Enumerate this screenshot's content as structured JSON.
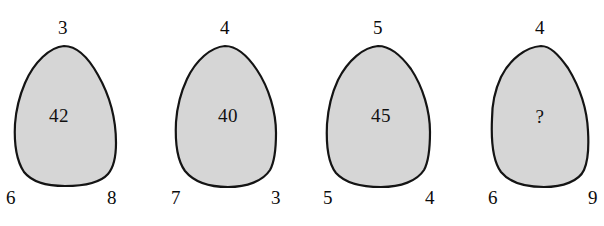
{
  "figure": {
    "type": "puzzle-diagram",
    "background_color": "#ffffff",
    "shape_fill_color": "#d6d6d6",
    "shape_stroke_color": "#141414"
  },
  "shapes": [
    {
      "id": "shape-1",
      "top": "3",
      "bottom_left": "6",
      "bottom_right": "8",
      "inner": "42"
    },
    {
      "id": "shape-2",
      "top": "4",
      "bottom_left": "7",
      "bottom_right": "3",
      "inner": "40"
    },
    {
      "id": "shape-3",
      "top": "5",
      "bottom_left": "5",
      "bottom_right": "4",
      "inner": "45"
    },
    {
      "id": "shape-4",
      "top": "4",
      "bottom_left": "6",
      "bottom_right": "9",
      "inner": "?"
    }
  ]
}
